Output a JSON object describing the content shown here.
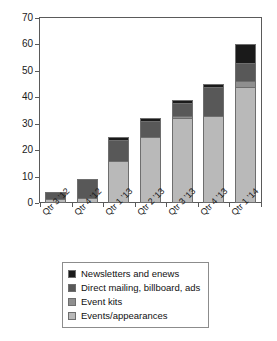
{
  "chart_data": {
    "type": "bar",
    "subtype": "stacked-bar",
    "title": "",
    "xlabel": "",
    "ylabel": "",
    "ylim": [
      0,
      70
    ],
    "ytick_step": 10,
    "yticks": [
      0,
      10,
      20,
      30,
      40,
      50,
      60,
      70
    ],
    "grid": false,
    "legend_position": "bottom",
    "categories": [
      "Qtr 3 '12",
      "Qtr 4 '12",
      "Qtr 1 '13",
      "Qtr 2 '13",
      "Qtr 3 '13",
      "Qtr 4 '13",
      "Qtr 1 '14"
    ],
    "series": [
      {
        "name": "Events/appearances",
        "color": "#b9b9b9",
        "values": [
          1.5,
          2,
          16,
          25,
          32,
          33,
          44
        ]
      },
      {
        "name": "Event kits",
        "color": "#8f8f8f",
        "values": [
          0,
          0,
          0,
          0,
          1,
          0,
          2
        ]
      },
      {
        "name": "Direct mailing, billboard, ads",
        "color": "#585858",
        "values": [
          2.5,
          7,
          8,
          6,
          5,
          11,
          7
        ]
      },
      {
        "name": "Newsletters and enews",
        "color": "#1a1a1a",
        "values": [
          0,
          0,
          1,
          1,
          1,
          1,
          7
        ]
      }
    ],
    "totals": [
      4,
      9,
      25,
      32,
      39,
      45,
      60
    ],
    "stack_order_bottom_to_top": [
      "Events/appearances",
      "Event kits",
      "Direct mailing, billboard, ads",
      "Newsletters and enews"
    ]
  },
  "legend": {
    "items": [
      {
        "label": "Newsletters and enews",
        "color": "#1a1a1a"
      },
      {
        "label": "Direct mailing, billboard, ads",
        "color": "#585858"
      },
      {
        "label": "Event kits",
        "color": "#8f8f8f"
      },
      {
        "label": "Events/appearances",
        "color": "#b9b9b9"
      }
    ]
  },
  "axes": {
    "y_tick_labels": [
      "0",
      "10",
      "20",
      "30",
      "40",
      "50",
      "60",
      "70"
    ],
    "x_tick_labels": [
      "Qtr 3 '12",
      "Qtr 4 '12",
      "Qtr 1 '13",
      "Qtr 2 '13",
      "Qtr 3 '13",
      "Qtr 4 '13",
      "Qtr 1 '14"
    ]
  },
  "style": {
    "frame_color": "#5a5a5a",
    "background": "#ffffff",
    "text_color": "#1a1a1a"
  }
}
